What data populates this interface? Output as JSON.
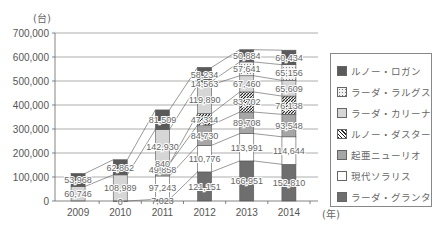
{
  "chart_data": {
    "type": "bar",
    "stacked": true,
    "title": "",
    "xlabel": "(年)",
    "ylabel": "(台)",
    "ylim": [
      0,
      700000
    ],
    "yticks": [
      "0",
      "100,000",
      "200,000",
      "300,000",
      "400,000",
      "500,000",
      "600,000",
      "700,000"
    ],
    "grid": true,
    "legend_position": "right",
    "categories": [
      "2009",
      "2010",
      "2011",
      "2012",
      "2013",
      "2014"
    ],
    "series": [
      {
        "name": "ラーダ・グランタ",
        "color": "#6e6e6e",
        "pattern": "solid",
        "values": [
          null,
          0,
          7023,
          121151,
          166951,
          152810
        ],
        "labels": [
          "",
          "0",
          "7,023",
          "121,151",
          "166,951",
          "152,810"
        ]
      },
      {
        "name": "現代ソラリス",
        "color": "#ffffff",
        "pattern": "solid",
        "values": [
          null,
          null,
          97243,
          110776,
          113991,
          114644
        ],
        "labels": [
          "",
          "",
          "97,243",
          "110,776",
          "113,991",
          "114,644"
        ]
      },
      {
        "name": "起亜ニューリオ",
        "color": "#a6a6a6",
        "pattern": "solid",
        "values": [
          null,
          null,
          49858,
          84730,
          89708,
          93548
        ],
        "labels": [
          "",
          "",
          "49,858",
          "84,730",
          "89,708",
          "93,548"
        ]
      },
      {
        "name": "ルノー・ダスター",
        "color": "#444444",
        "pattern": "hatch",
        "values": [
          null,
          null,
          840,
          47344,
          83702,
          76138
        ],
        "labels": [
          "",
          "",
          "840",
          "47,344",
          "83,702",
          "76,138"
        ]
      },
      {
        "name": "ラーダ・カリーナ",
        "color": "#d6d6d6",
        "pattern": "solid",
        "values": [
          60746,
          108989,
          142930,
          119890,
          67460,
          65609
        ],
        "labels": [
          "60,746",
          "108,989",
          "142,930",
          "119,890",
          "67,460",
          "65,609"
        ]
      },
      {
        "name": "ラーダ・ラルグス",
        "color": "#e8e8e8",
        "pattern": "dots",
        "values": [
          null,
          null,
          null,
          14563,
          57641,
          65156
        ],
        "labels": [
          "",
          "",
          "",
          "14,563",
          "57,641",
          "65,156"
        ]
      },
      {
        "name": "ルノー・ロガン",
        "color": "#5a5a5a",
        "pattern": "solid",
        "values": [
          53968,
          62862,
          81509,
          58234,
          50884,
          60434
        ],
        "labels": [
          "53,968",
          "62,862",
          "81,509",
          "58,234",
          "50,884",
          "60,434"
        ]
      }
    ]
  },
  "legend": {
    "items": [
      {
        "label": "ルノー・ロガン",
        "series_index": 6
      },
      {
        "label": "ラーダ・ラルグス",
        "series_index": 5
      },
      {
        "label": "ラーダ・カリーナ",
        "series_index": 4
      },
      {
        "label": "ルノー・ダスター",
        "series_index": 3
      },
      {
        "label": "起亜ニューリオ",
        "series_index": 2
      },
      {
        "label": "現代ソラリス",
        "series_index": 1
      },
      {
        "label": "ラーダ・グランタ",
        "series_index": 0
      }
    ]
  },
  "units": {
    "y": "(台)",
    "x": "(年)"
  }
}
